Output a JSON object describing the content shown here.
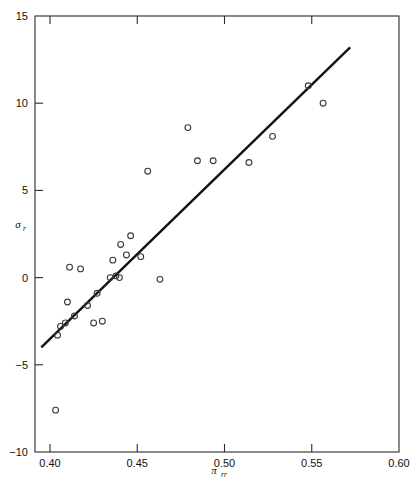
{
  "chart_data": {
    "type": "scatter",
    "title": "",
    "subtitle": "",
    "xlabel": "π",
    "xlabel_sub": "rr",
    "ylabel": "σ",
    "ylabel_sub": "r",
    "xlim": [
      0.4,
      0.6
    ],
    "ylim": [
      -10,
      15
    ],
    "xticks": [
      0.4,
      0.45,
      0.5,
      0.55,
      0.6
    ],
    "xtick_labels": [
      "0.40",
      "0.45",
      "0.50",
      "0.55",
      "0.60"
    ],
    "yticks": [
      -10,
      -5,
      0,
      5,
      10,
      15
    ],
    "ytick_labels": [
      "−10",
      "−5",
      "0",
      "5",
      "10",
      "15"
    ],
    "grid": false,
    "legend": null,
    "marker": "open-circle",
    "marker_color": "#3a3a3a",
    "line_color": "#111111",
    "background": "#ffffff",
    "points": [
      {
        "x": 0.4032,
        "y": -7.6
      },
      {
        "x": 0.4043,
        "y": -3.3
      },
      {
        "x": 0.406,
        "y": -2.8
      },
      {
        "x": 0.4088,
        "y": -2.6
      },
      {
        "x": 0.41,
        "y": -1.4
      },
      {
        "x": 0.4112,
        "y": 0.6
      },
      {
        "x": 0.414,
        "y": -2.2
      },
      {
        "x": 0.4175,
        "y": 0.5
      },
      {
        "x": 0.4215,
        "y": -1.6
      },
      {
        "x": 0.425,
        "y": -2.6
      },
      {
        "x": 0.427,
        "y": -0.9
      },
      {
        "x": 0.43,
        "y": -2.5
      },
      {
        "x": 0.4345,
        "y": 0.0
      },
      {
        "x": 0.436,
        "y": 1.0
      },
      {
        "x": 0.4378,
        "y": 0.1
      },
      {
        "x": 0.4398,
        "y": 0.0
      },
      {
        "x": 0.4405,
        "y": 1.9
      },
      {
        "x": 0.4438,
        "y": 1.3
      },
      {
        "x": 0.4462,
        "y": 2.4
      },
      {
        "x": 0.452,
        "y": 1.2
      },
      {
        "x": 0.456,
        "y": 6.1
      },
      {
        "x": 0.463,
        "y": -0.1
      },
      {
        "x": 0.479,
        "y": 8.6
      },
      {
        "x": 0.4845,
        "y": 6.7
      },
      {
        "x": 0.4935,
        "y": 6.7
      },
      {
        "x": 0.514,
        "y": 6.6
      },
      {
        "x": 0.5275,
        "y": 8.1
      },
      {
        "x": 0.548,
        "y": 11.0
      },
      {
        "x": 0.5565,
        "y": 10.0
      }
    ],
    "fit_line": {
      "type": "linear-fit",
      "x_start": 0.395,
      "y_start": -4.0,
      "x_end": 0.572,
      "y_end": 13.2,
      "slope": 97.2,
      "intercept": -42.4
    }
  }
}
